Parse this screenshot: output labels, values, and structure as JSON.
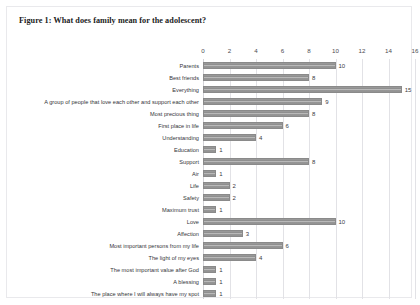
{
  "figure": {
    "title": "Figure 1: What does family mean for the adolescent?"
  },
  "colors": {
    "bar_fill": "#9c9c9c",
    "bar_highlight": "#b9b9b9",
    "bar_stroke": "#8a8a8a",
    "gridline": "#e2e2e6",
    "frame": "#e9e9ec",
    "text": "#333338"
  },
  "chart_data": {
    "type": "bar",
    "orientation": "horizontal",
    "title": "Figure 1: What does family mean for the adolescent?",
    "xlabel": "",
    "ylabel": "",
    "xlim": [
      0,
      16
    ],
    "xticks": [
      0,
      2,
      4,
      6,
      8,
      10,
      12,
      14,
      16
    ],
    "grid": true,
    "legend": "none",
    "data_labels": true,
    "categories": [
      "Parents",
      "Best friends",
      "Everything",
      "A group of people that love each other and support each other",
      "Most precious thing",
      "First place in life",
      "Understanding",
      "Education",
      "Support",
      "Air",
      "Life",
      "Safety",
      "Maximum trust",
      "Love",
      "Affection",
      "Most important persons from my life",
      "The light of my eyes",
      "The most important value after God",
      "A blessing",
      "The place where I will always have my spot"
    ],
    "values": [
      10,
      8,
      15,
      9,
      8,
      6,
      4,
      1,
      8,
      1,
      2,
      2,
      1,
      10,
      3,
      6,
      4,
      1,
      1,
      1
    ]
  }
}
